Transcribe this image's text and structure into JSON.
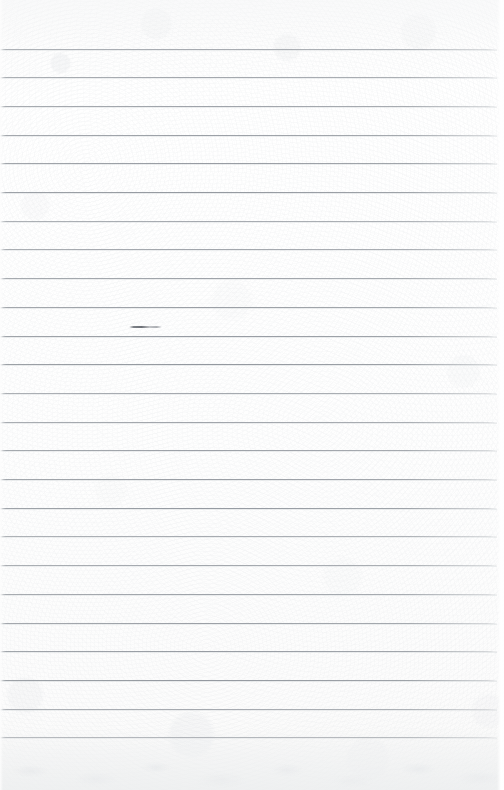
{
  "document": {
    "kind": "ruled-notebook-page",
    "title": "Blank lined paper page",
    "content_text": "",
    "page_width": 504,
    "page_height": 790,
    "colors": {
      "paper": "#fdfdfd",
      "paper_edge": "#f5f6f7",
      "rule_line": "#969ba1",
      "rule_shadow": "#ced1d5",
      "ink_mark": "#686c73"
    },
    "ruling": {
      "line_count": 25,
      "first_line_y": 48.5,
      "line_spacing": 28.7,
      "line_thickness": 1,
      "line_start_x": 0,
      "line_end_x": 497
    },
    "marks": [
      {
        "name": "ink-smudge",
        "x": 129,
        "y": 326,
        "width": 33,
        "height": 2,
        "on_line_index": 10
      }
    ],
    "margins": {
      "top": 48,
      "bottom": 50,
      "left": 0,
      "right": 7
    }
  }
}
